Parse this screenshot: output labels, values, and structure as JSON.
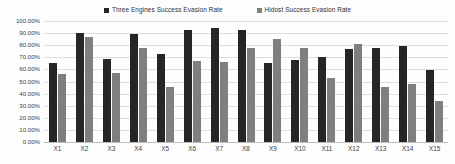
{
  "chart_data": {
    "type": "bar",
    "title": "",
    "xlabel": "",
    "ylabel": "",
    "ylim": [
      0,
      100
    ],
    "grid": true,
    "legend_position": "top-center",
    "categories": [
      "X1",
      "X2",
      "X3",
      "X4",
      "X5",
      "X6",
      "X7",
      "X8",
      "X9",
      "X10",
      "X11",
      "X12",
      "X13",
      "X14",
      "X15"
    ],
    "ytick_labels": [
      "100.00%",
      "90.00%",
      "80.00%",
      "70.00%",
      "60.00%",
      "50.00%",
      "40.00%",
      "30.00%",
      "20.00%",
      "10.00%",
      "0.00%"
    ],
    "ytick_values": [
      100,
      90,
      80,
      70,
      60,
      50,
      40,
      30,
      20,
      10,
      0
    ],
    "series": [
      {
        "name": "Three Engines Success Evasion  Rate",
        "color": "#262626",
        "values": [
          65.5,
          90.5,
          68.5,
          89.5,
          72.5,
          92.5,
          94.0,
          92.5,
          65.5,
          67.5,
          70.0,
          77.0,
          78.0,
          79.5,
          59.5
        ]
      },
      {
        "name": "Hidost Success Evasion Rate",
        "color": "#7f7f7f",
        "values": [
          56.0,
          86.5,
          57.0,
          78.0,
          45.5,
          67.0,
          66.0,
          78.0,
          85.5,
          77.5,
          53.0,
          81.0,
          45.5,
          48.0,
          33.5
        ]
      }
    ]
  },
  "legend": {
    "entries": [
      {
        "label": "Three Engines Success Evasion  Rate",
        "marker": "square-swatch-dark",
        "color": "#262626"
      },
      {
        "label": "Hidost Success Evasion Rate",
        "marker": "square-swatch-gray",
        "color": "#7f7f7f"
      }
    ]
  }
}
